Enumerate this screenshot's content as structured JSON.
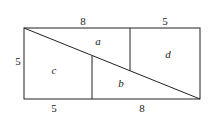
{
  "diagram": {
    "labels": {
      "top_left": "8",
      "top_right": "5",
      "left": "5",
      "bottom_left": "5",
      "bottom_right": "8"
    },
    "regions": {
      "a": "a",
      "b": "b",
      "c": "c",
      "d": "d"
    },
    "stroke_color": "#222222"
  }
}
